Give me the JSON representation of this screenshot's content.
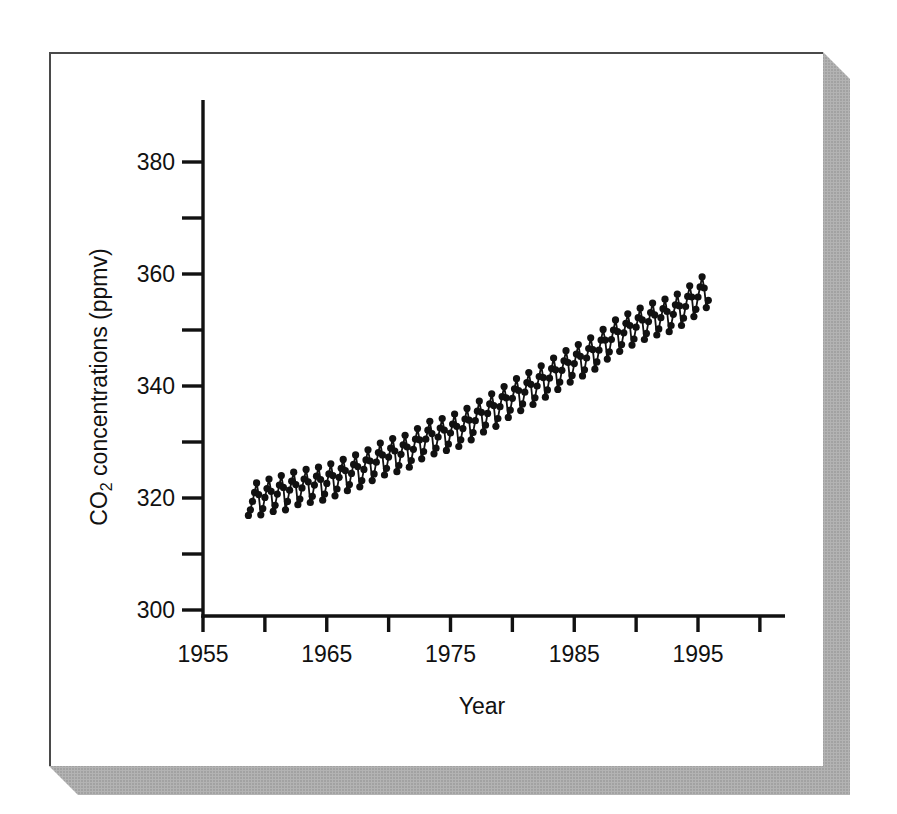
{
  "colors": {
    "ink": "#111111",
    "page_background": "#ffffff",
    "page_border": "#4a4a4a",
    "shadow_base": "#b3b3b3",
    "shadow_speckle": "#8d8d8d"
  },
  "chart_data": {
    "type": "line",
    "marker": "filled-circle",
    "title": "",
    "xlabel": "Year",
    "ylabel": "CO₂ concentrations (ppmv)",
    "ylabel_parts": {
      "prefix": "CO",
      "subscript": "2",
      "suffix": " concentrations (ppmv)"
    },
    "grid": false,
    "legend": "none",
    "x_axis": {
      "range_shown": [
        1955,
        2002
      ],
      "ticks": [
        1955,
        1960,
        1965,
        1970,
        1975,
        1980,
        1985,
        1990,
        1995,
        2000
      ],
      "tick_labels": [
        "1955",
        "",
        "1965",
        "",
        "1975",
        "",
        "1985",
        "",
        "1995",
        ""
      ]
    },
    "y_axis": {
      "range_shown": [
        300,
        391
      ],
      "ticks": [
        300,
        310,
        320,
        330,
        340,
        350,
        360,
        370,
        380
      ],
      "tick_labels": [
        "300",
        "",
        "320",
        "",
        "340",
        "",
        "360",
        "",
        "380"
      ]
    },
    "points": [
      [
        1958.67,
        316.9
      ],
      [
        1958.83,
        317.9
      ],
      [
        1959.0,
        319.4
      ],
      [
        1959.17,
        321.0
      ],
      [
        1959.33,
        322.7
      ],
      [
        1959.5,
        320.6
      ],
      [
        1959.67,
        317.0
      ],
      [
        1959.83,
        318.1
      ],
      [
        1960.0,
        320.1
      ],
      [
        1960.17,
        321.7
      ],
      [
        1960.33,
        323.4
      ],
      [
        1960.5,
        321.2
      ],
      [
        1960.67,
        317.6
      ],
      [
        1960.83,
        318.7
      ],
      [
        1961.0,
        320.7
      ],
      [
        1961.17,
        322.3
      ],
      [
        1961.33,
        324.0
      ],
      [
        1961.5,
        321.9
      ],
      [
        1961.67,
        317.9
      ],
      [
        1961.83,
        319.4
      ],
      [
        1962.0,
        321.4
      ],
      [
        1962.17,
        323.0
      ],
      [
        1962.33,
        324.6
      ],
      [
        1962.5,
        322.4
      ],
      [
        1962.67,
        318.8
      ],
      [
        1962.83,
        319.8
      ],
      [
        1963.0,
        321.8
      ],
      [
        1963.17,
        323.4
      ],
      [
        1963.33,
        325.1
      ],
      [
        1963.5,
        322.9
      ],
      [
        1963.67,
        319.2
      ],
      [
        1963.83,
        320.3
      ],
      [
        1964.0,
        322.3
      ],
      [
        1964.17,
        323.9
      ],
      [
        1964.33,
        325.5
      ],
      [
        1964.5,
        323.3
      ],
      [
        1964.67,
        319.6
      ],
      [
        1964.83,
        320.7
      ],
      [
        1965.0,
        322.6
      ],
      [
        1965.17,
        324.3
      ],
      [
        1965.33,
        326.1
      ],
      [
        1965.5,
        324.0
      ],
      [
        1965.67,
        320.4
      ],
      [
        1965.83,
        321.6
      ],
      [
        1966.0,
        323.7
      ],
      [
        1966.17,
        325.3
      ],
      [
        1966.33,
        326.9
      ],
      [
        1966.5,
        324.9
      ],
      [
        1966.67,
        321.3
      ],
      [
        1966.83,
        322.4
      ],
      [
        1967.0,
        324.4
      ],
      [
        1967.17,
        326.0
      ],
      [
        1967.33,
        327.7
      ],
      [
        1967.5,
        325.6
      ],
      [
        1967.67,
        322.0
      ],
      [
        1967.83,
        323.1
      ],
      [
        1968.0,
        325.1
      ],
      [
        1968.17,
        326.8
      ],
      [
        1968.33,
        328.6
      ],
      [
        1968.5,
        326.6
      ],
      [
        1968.67,
        323.1
      ],
      [
        1968.83,
        324.3
      ],
      [
        1969.0,
        326.4
      ],
      [
        1969.17,
        328.1
      ],
      [
        1969.33,
        329.8
      ],
      [
        1969.5,
        327.7
      ],
      [
        1969.67,
        324.1
      ],
      [
        1969.83,
        325.3
      ],
      [
        1970.0,
        327.3
      ],
      [
        1970.17,
        328.9
      ],
      [
        1970.33,
        330.6
      ],
      [
        1970.5,
        328.4
      ],
      [
        1970.67,
        324.7
      ],
      [
        1970.83,
        325.8
      ],
      [
        1971.0,
        327.8
      ],
      [
        1971.17,
        329.5
      ],
      [
        1971.33,
        331.2
      ],
      [
        1971.5,
        329.1
      ],
      [
        1971.67,
        325.5
      ],
      [
        1971.83,
        326.7
      ],
      [
        1972.0,
        328.7
      ],
      [
        1972.17,
        330.5
      ],
      [
        1972.33,
        332.4
      ],
      [
        1972.5,
        330.4
      ],
      [
        1972.67,
        327.0
      ],
      [
        1972.83,
        328.3
      ],
      [
        1973.0,
        330.5
      ],
      [
        1973.17,
        332.1
      ],
      [
        1973.33,
        333.7
      ],
      [
        1973.5,
        331.5
      ],
      [
        1973.67,
        327.9
      ],
      [
        1973.83,
        328.9
      ],
      [
        1974.0,
        330.9
      ],
      [
        1974.17,
        332.5
      ],
      [
        1974.33,
        334.2
      ],
      [
        1974.5,
        332.1
      ],
      [
        1974.67,
        328.5
      ],
      [
        1974.83,
        329.6
      ],
      [
        1975.0,
        331.6
      ],
      [
        1975.17,
        333.2
      ],
      [
        1975.33,
        335.0
      ],
      [
        1975.5,
        332.8
      ],
      [
        1975.67,
        329.2
      ],
      [
        1975.83,
        330.4
      ],
      [
        1976.0,
        332.4
      ],
      [
        1976.17,
        334.1
      ],
      [
        1976.33,
        336.0
      ],
      [
        1976.5,
        333.9
      ],
      [
        1976.67,
        330.4
      ],
      [
        1976.83,
        331.7
      ],
      [
        1977.0,
        333.8
      ],
      [
        1977.17,
        335.5
      ],
      [
        1977.33,
        337.3
      ],
      [
        1977.5,
        335.3
      ],
      [
        1977.67,
        331.8
      ],
      [
        1977.83,
        333.0
      ],
      [
        1978.0,
        335.1
      ],
      [
        1978.17,
        336.8
      ],
      [
        1978.33,
        338.6
      ],
      [
        1978.5,
        336.5
      ],
      [
        1978.67,
        332.8
      ],
      [
        1978.83,
        334.2
      ],
      [
        1979.0,
        336.3
      ],
      [
        1979.17,
        338.1
      ],
      [
        1979.33,
        339.9
      ],
      [
        1979.5,
        337.9
      ],
      [
        1979.67,
        334.4
      ],
      [
        1979.83,
        335.7
      ],
      [
        1980.0,
        337.8
      ],
      [
        1980.17,
        339.5
      ],
      [
        1980.33,
        341.3
      ],
      [
        1980.5,
        339.2
      ],
      [
        1980.67,
        335.6
      ],
      [
        1980.83,
        336.8
      ],
      [
        1981.0,
        338.9
      ],
      [
        1981.17,
        340.6
      ],
      [
        1981.33,
        342.4
      ],
      [
        1981.5,
        340.3
      ],
      [
        1981.67,
        336.7
      ],
      [
        1981.83,
        337.9
      ],
      [
        1982.0,
        340.0
      ],
      [
        1982.17,
        341.7
      ],
      [
        1982.33,
        343.6
      ],
      [
        1982.5,
        341.5
      ],
      [
        1982.67,
        338.0
      ],
      [
        1982.83,
        339.3
      ],
      [
        1983.0,
        341.4
      ],
      [
        1983.17,
        343.1
      ],
      [
        1983.33,
        345.0
      ],
      [
        1983.5,
        342.9
      ],
      [
        1983.67,
        339.4
      ],
      [
        1983.83,
        340.7
      ],
      [
        1984.0,
        342.8
      ],
      [
        1984.17,
        344.5
      ],
      [
        1984.33,
        346.3
      ],
      [
        1984.5,
        344.2
      ],
      [
        1984.67,
        340.7
      ],
      [
        1984.83,
        341.9
      ],
      [
        1985.0,
        344.0
      ],
      [
        1985.17,
        345.7
      ],
      [
        1985.33,
        347.4
      ],
      [
        1985.5,
        345.3
      ],
      [
        1985.67,
        341.8
      ],
      [
        1985.83,
        342.9
      ],
      [
        1986.0,
        345.0
      ],
      [
        1986.17,
        346.7
      ],
      [
        1986.33,
        348.6
      ],
      [
        1986.5,
        346.5
      ],
      [
        1986.67,
        343.0
      ],
      [
        1986.83,
        344.3
      ],
      [
        1987.0,
        346.4
      ],
      [
        1987.17,
        348.2
      ],
      [
        1987.33,
        350.1
      ],
      [
        1987.5,
        348.2
      ],
      [
        1987.67,
        344.8
      ],
      [
        1987.83,
        346.1
      ],
      [
        1988.0,
        348.3
      ],
      [
        1988.17,
        350.0
      ],
      [
        1988.33,
        351.8
      ],
      [
        1988.5,
        349.7
      ],
      [
        1988.67,
        346.2
      ],
      [
        1988.83,
        347.4
      ],
      [
        1989.0,
        349.5
      ],
      [
        1989.17,
        351.2
      ],
      [
        1989.33,
        352.9
      ],
      [
        1989.5,
        350.8
      ],
      [
        1989.67,
        347.3
      ],
      [
        1989.83,
        348.4
      ],
      [
        1990.0,
        350.5
      ],
      [
        1990.17,
        352.2
      ],
      [
        1990.33,
        353.9
      ],
      [
        1990.5,
        351.8
      ],
      [
        1990.67,
        348.3
      ],
      [
        1990.83,
        349.4
      ],
      [
        1991.0,
        351.5
      ],
      [
        1991.17,
        353.1
      ],
      [
        1991.33,
        354.8
      ],
      [
        1991.5,
        352.7
      ],
      [
        1991.67,
        349.1
      ],
      [
        1991.83,
        350.2
      ],
      [
        1992.0,
        352.2
      ],
      [
        1992.17,
        353.8
      ],
      [
        1992.33,
        355.5
      ],
      [
        1992.5,
        353.3
      ],
      [
        1992.67,
        349.7
      ],
      [
        1992.83,
        350.8
      ],
      [
        1993.0,
        352.8
      ],
      [
        1993.17,
        354.5
      ],
      [
        1993.33,
        356.4
      ],
      [
        1993.5,
        354.3
      ],
      [
        1993.67,
        350.8
      ],
      [
        1993.83,
        352.1
      ],
      [
        1994.0,
        354.2
      ],
      [
        1994.17,
        356.0
      ],
      [
        1994.33,
        357.9
      ],
      [
        1994.5,
        355.9
      ],
      [
        1994.67,
        352.4
      ],
      [
        1994.83,
        353.7
      ],
      [
        1995.0,
        355.9
      ],
      [
        1995.17,
        357.7
      ],
      [
        1995.33,
        359.5
      ],
      [
        1995.5,
        357.5
      ],
      [
        1995.67,
        354.0
      ],
      [
        1995.83,
        355.3
      ]
    ]
  }
}
